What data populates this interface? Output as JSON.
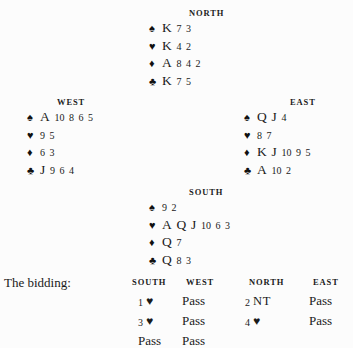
{
  "page": {
    "background_color": "#fcfcfc",
    "text_color": "#1a1a1a"
  },
  "suit_symbols": {
    "spade": "♠",
    "heart": "♥",
    "diamond": "♦",
    "club": "♣"
  },
  "hands": {
    "north": {
      "label": "NORTH",
      "suits": [
        {
          "suit": "spade",
          "symbol": "♠",
          "cards": "K 7 3",
          "honors": [
            "K"
          ],
          "spots": [
            "7",
            "3"
          ]
        },
        {
          "suit": "heart",
          "symbol": "♥",
          "cards": "K 4 2",
          "honors": [
            "K"
          ],
          "spots": [
            "4",
            "2"
          ]
        },
        {
          "suit": "diamond",
          "symbol": "♦",
          "cards": "A 8 4 2",
          "honors": [
            "A"
          ],
          "spots": [
            "8",
            "4",
            "2"
          ]
        },
        {
          "suit": "club",
          "symbol": "♣",
          "cards": "K 7 5",
          "honors": [
            "K"
          ],
          "spots": [
            "7",
            "5"
          ]
        }
      ]
    },
    "west": {
      "label": "WEST",
      "suits": [
        {
          "suit": "spade",
          "symbol": "♠",
          "cards": "A 10 8 6 5",
          "honors": [
            "A"
          ],
          "spots": [
            "10",
            "8",
            "6",
            "5"
          ]
        },
        {
          "suit": "heart",
          "symbol": "♥",
          "cards": "9 5",
          "honors": [],
          "spots": [
            "9",
            "5"
          ]
        },
        {
          "suit": "diamond",
          "symbol": "♦",
          "cards": "6 3",
          "honors": [],
          "spots": [
            "6",
            "3"
          ]
        },
        {
          "suit": "club",
          "symbol": "♣",
          "cards": "J 9 6 4",
          "honors": [
            "J"
          ],
          "spots": [
            "9",
            "6",
            "4"
          ]
        }
      ]
    },
    "east": {
      "label": "EAST",
      "suits": [
        {
          "suit": "spade",
          "symbol": "♠",
          "cards": "Q J 4",
          "honors": [
            "Q",
            "J"
          ],
          "spots": [
            "4"
          ]
        },
        {
          "suit": "heart",
          "symbol": "♥",
          "cards": "8 7",
          "honors": [],
          "spots": [
            "8",
            "7"
          ]
        },
        {
          "suit": "diamond",
          "symbol": "♦",
          "cards": "K J 10 9 5",
          "honors": [
            "K",
            "J"
          ],
          "spots": [
            "10",
            "9",
            "5"
          ]
        },
        {
          "suit": "club",
          "symbol": "♣",
          "cards": "A 10 2",
          "honors": [
            "A"
          ],
          "spots": [
            "10",
            "2"
          ]
        }
      ]
    },
    "south": {
      "label": "SOUTH",
      "suits": [
        {
          "suit": "spade",
          "symbol": "♠",
          "cards": "9 2",
          "honors": [],
          "spots": [
            "9",
            "2"
          ]
        },
        {
          "suit": "heart",
          "symbol": "♥",
          "cards": "A Q J 10 6 3",
          "honors": [
            "A",
            "Q",
            "J"
          ],
          "spots": [
            "10",
            "6",
            "3"
          ]
        },
        {
          "suit": "diamond",
          "symbol": "♦",
          "cards": "Q 7",
          "honors": [
            "Q"
          ],
          "spots": [
            "7"
          ]
        },
        {
          "suit": "club",
          "symbol": "♣",
          "cards": "Q 8 3",
          "honors": [
            "Q"
          ],
          "spots": [
            "8",
            "3"
          ]
        }
      ]
    }
  },
  "bidding": {
    "caption": "The bidding:",
    "columns": [
      "SOUTH",
      "WEST",
      "NORTH",
      "EAST"
    ],
    "rows": [
      [
        {
          "level": "1",
          "denomination": "♥",
          "kind": "suit",
          "text": "1 ♥"
        },
        {
          "text": "Pass",
          "kind": "pass"
        },
        {
          "level": "2",
          "denomination": "NT",
          "kind": "notrump",
          "text": "2 NT"
        },
        {
          "text": "Pass",
          "kind": "pass"
        }
      ],
      [
        {
          "level": "3",
          "denomination": "♥",
          "kind": "suit",
          "text": "3 ♥"
        },
        {
          "text": "Pass",
          "kind": "pass"
        },
        {
          "level": "4",
          "denomination": "♥",
          "kind": "suit",
          "text": "4 ♥"
        },
        {
          "text": "Pass",
          "kind": "pass"
        }
      ],
      [
        {
          "text": "Pass",
          "kind": "pass"
        },
        {
          "text": "Pass",
          "kind": "pass"
        },
        {
          "text": "",
          "kind": "empty"
        },
        {
          "text": "",
          "kind": "empty"
        }
      ]
    ]
  }
}
